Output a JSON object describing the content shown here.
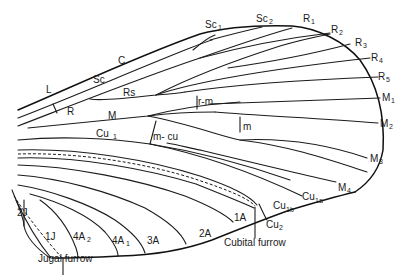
{
  "diagram": {
    "type": "insect-wing-venation",
    "colors": {
      "line": "#1c1c1c",
      "background": "#ffffff"
    },
    "vein_labels": {
      "C": "C",
      "Sc": "Sc",
      "Sc1": "Sc",
      "Sc1_sub": "1",
      "Sc2": "Sc",
      "Sc2_sub": "2",
      "L": "L",
      "R": "R",
      "Rs": "Rs",
      "R1": "R",
      "R1_sub": "1",
      "R2": "R",
      "R2_sub": "2",
      "R3": "R",
      "R3_sub": "3",
      "R4": "R",
      "R4_sub": "4",
      "R5": "R",
      "R5_sub": "5",
      "M": "M",
      "M1": "M",
      "M1_sub": "1",
      "M2": "M",
      "M2_sub": "2",
      "M3": "M",
      "M3_sub": "3",
      "M4": "M",
      "M4_sub": "4",
      "rm": "r-m",
      "m": "m",
      "mcu": "m- cu",
      "Cu1": "Cu",
      "Cu1_sub": "1",
      "Cu1a": "Cu",
      "Cu1a_sub": "1a",
      "Cu1b": "Cu",
      "Cu1b_sub": "1b",
      "Cu2": "Cu",
      "Cu2_sub": "2",
      "A1": "1A",
      "A2": "2A",
      "A3": "3A",
      "A4_1": "4A",
      "A4_1_sub": "1",
      "A4_2": "4A",
      "A4_2_sub": "2",
      "J1": "1J",
      "J2": "2J"
    },
    "furrow_labels": {
      "cubital": "Cubital furrow",
      "jugal": "Jugal furrow"
    }
  }
}
